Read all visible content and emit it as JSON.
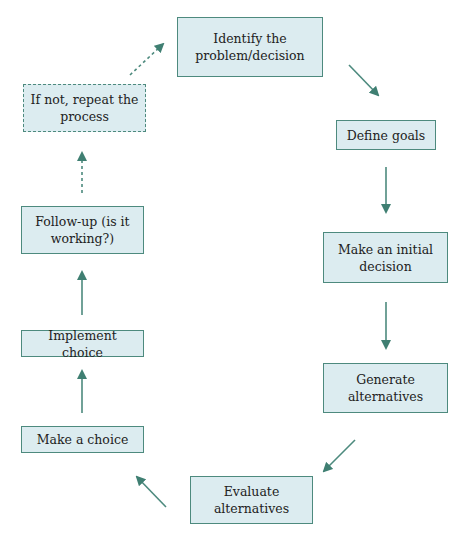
{
  "diagram": {
    "type": "cycle-flowchart",
    "accent_color": "#3f7f72",
    "box_fill": "#dcecf0",
    "nodes": [
      {
        "id": "identify",
        "label": "Identify the problem/decision",
        "style": "solid"
      },
      {
        "id": "define",
        "label": "Define goals",
        "style": "solid"
      },
      {
        "id": "initial",
        "label": "Make an initial decision",
        "style": "solid"
      },
      {
        "id": "generate",
        "label": "Generate alternatives",
        "style": "solid"
      },
      {
        "id": "evaluate",
        "label": "Evaluate alternatives",
        "style": "solid"
      },
      {
        "id": "choice",
        "label": "Make a choice",
        "style": "solid"
      },
      {
        "id": "implement",
        "label": "Implement choice",
        "style": "solid"
      },
      {
        "id": "followup",
        "label": "Follow-up (is it working?)",
        "style": "solid"
      },
      {
        "id": "repeat",
        "label": "If not, repeat the process",
        "style": "dashed"
      }
    ],
    "edges": [
      {
        "from": "identify",
        "to": "define",
        "style": "solid"
      },
      {
        "from": "define",
        "to": "initial",
        "style": "solid"
      },
      {
        "from": "initial",
        "to": "generate",
        "style": "solid"
      },
      {
        "from": "generate",
        "to": "evaluate",
        "style": "solid"
      },
      {
        "from": "evaluate",
        "to": "choice",
        "style": "solid"
      },
      {
        "from": "choice",
        "to": "implement",
        "style": "solid"
      },
      {
        "from": "implement",
        "to": "followup",
        "style": "solid"
      },
      {
        "from": "followup",
        "to": "repeat",
        "style": "dotted"
      },
      {
        "from": "repeat",
        "to": "identify",
        "style": "dotted"
      }
    ]
  }
}
